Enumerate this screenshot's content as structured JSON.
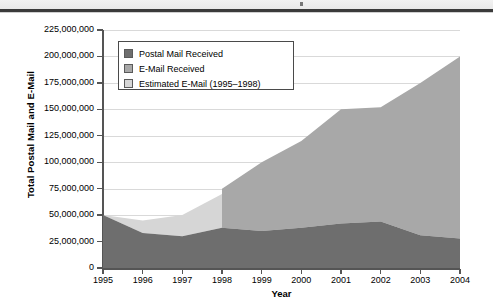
{
  "chart_data": {
    "type": "area",
    "stacked": true,
    "title": "",
    "subtitle": "",
    "xlabel": "Year",
    "ylabel": "Total Postal Mail and E-Mail",
    "categories": [
      1995,
      1996,
      1997,
      1998,
      1999,
      2000,
      2001,
      2002,
      2003,
      2004
    ],
    "x_tick_labels": [
      "1995",
      "1996",
      "1997",
      "1998",
      "1999",
      "2000",
      "2001",
      "2002",
      "2003",
      "2004"
    ],
    "y_tick_labels": [
      "0",
      "25,000,000",
      "50,000,000",
      "75,000,000",
      "100,000,000",
      "125,000,000",
      "150,000,000",
      "175,000,000",
      "200,000,000",
      "225,000,000"
    ],
    "y_tick_values": [
      0,
      25000000,
      50000000,
      75000000,
      100000000,
      125000000,
      150000000,
      175000000,
      200000000,
      225000000
    ],
    "ylim": [
      0,
      225000000
    ],
    "xlim": [
      1995,
      2004
    ],
    "grid": "horizontal",
    "legend_position": "upper-left-inside",
    "series": [
      {
        "name": "Postal Mail Received",
        "color": "#6e6e6e",
        "values": [
          50000000,
          33000000,
          30000000,
          38000000,
          35000000,
          38000000,
          42000000,
          44000000,
          31000000,
          28000000
        ]
      },
      {
        "name": "E-Mail Received",
        "color": "#a8a8a8",
        "note": "actual e-mail volume; plotted from 1998 onward",
        "values": [
          null,
          null,
          null,
          75000000,
          100000000,
          120000000,
          150000000,
          152000000,
          175000000,
          200000000
        ]
      },
      {
        "name": "Estimated E-Mail (1995–1998)",
        "color": "#d6d6d6",
        "note": "estimated e-mail volume; stacked total top edge 1995–1998",
        "values": [
          50000000,
          45000000,
          50000000,
          70000000,
          null,
          null,
          null,
          null,
          null,
          null
        ]
      }
    ],
    "annotations": [
      "Vertical step at 1998 where estimated e-mail series ends and measured e-mail series begins."
    ]
  },
  "legend": {
    "items": [
      {
        "label": "Postal Mail Received",
        "color": "#6e6e6e"
      },
      {
        "label": "E-Mail Received",
        "color": "#a8a8a8"
      },
      {
        "label": "Estimated E-Mail (1995–1998)",
        "color": "#d6d6d6"
      }
    ]
  },
  "axes": {
    "y_title": "Total Postal Mail and E-Mail",
    "x_title": "Year"
  }
}
